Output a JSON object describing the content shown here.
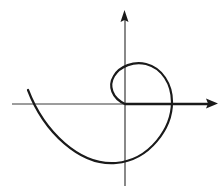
{
  "diagram": {
    "type": "polar spiral on cartesian axes",
    "colors": {
      "background": "#ffffff",
      "stroke": "#1a1a1a",
      "axis": "#2a2a2a"
    },
    "axes": {
      "x_axis": {
        "from": [
          12,
          104
        ],
        "to": [
          218,
          104
        ],
        "arrow": "right"
      },
      "y_axis": {
        "from": [
          125,
          186
        ],
        "to": [
          125,
          10
        ],
        "arrow": "up"
      }
    },
    "curve": {
      "description": "Spiral starting at the origin, looping counter-clockwise outward and ending upper-left",
      "path": "M125,104 C112,98 108,86 114,76 C120,66 134,61 146,64 C162,68 172,84 172,102 C172,128 150,160 116,163 C80,166 44,132 28,90"
    }
  }
}
